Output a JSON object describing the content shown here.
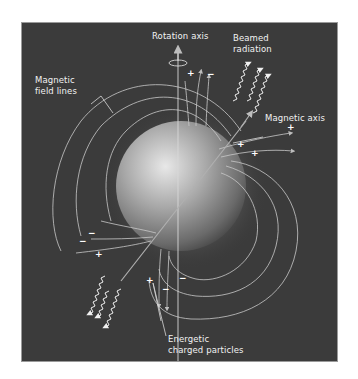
{
  "diagram": {
    "labels": {
      "rotation_axis": "Rotation axis",
      "beamed_radiation_1": "Beamed",
      "beamed_radiation_2": "radiation",
      "magnetic_field_lines_1": "Magnetic",
      "magnetic_field_lines_2": "field lines",
      "magnetic_axis": "Magnetic axis",
      "energetic_particles_1": "Energetic",
      "energetic_particles_2": "charged particles"
    },
    "charges": {
      "top_plus": "+",
      "top_minus": "−",
      "right_plus_1": "+",
      "right_plus_2": "+",
      "right_plus_3": "+",
      "left_minus_1": "−",
      "left_minus_2": "−",
      "left_plus": "+",
      "bottom_plus": "+",
      "bottom_minus_1": "−",
      "bottom_minus_2": "−"
    },
    "colors": {
      "background": "#3b3b3b",
      "lines": "#cfcfcf",
      "text": "#f2f2f2"
    }
  }
}
